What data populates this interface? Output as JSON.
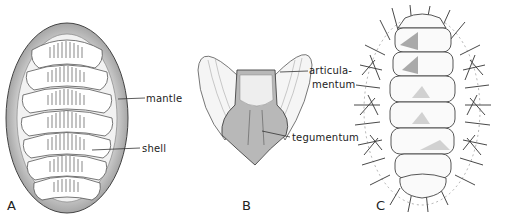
{
  "figure": {
    "panels": [
      {
        "id": "A",
        "letter": "A",
        "description": "Chiton dorsal view showing eight shell plates surrounded by mantle",
        "labels": {
          "mantle": "mantle",
          "shell": "shell"
        }
      },
      {
        "id": "B",
        "letter": "B",
        "description": "Single chiton shell plate (valve)",
        "labels": {
          "articulamentum_line1": "articula-",
          "articulamentum_line2": "mentum",
          "tegumentum": "tegumentum"
        }
      },
      {
        "id": "C",
        "letter": "C",
        "description": "Spiny chiton dorsal view with bristled girdle"
      }
    ],
    "colors": {
      "ink": "#222222",
      "shade": "#8a8a8a",
      "light_shade": "#c8c8c8",
      "background": "#ffffff"
    }
  }
}
